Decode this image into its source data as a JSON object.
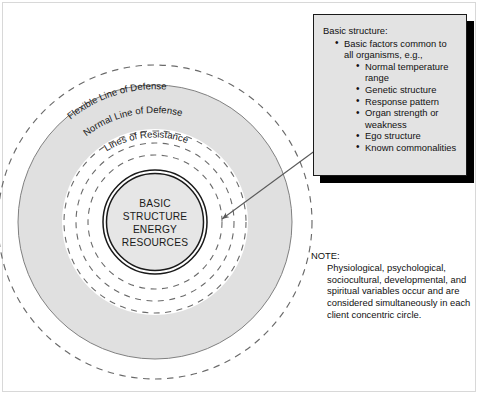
{
  "figure": {
    "colors": {
      "ring_fill": "#e0e0e0",
      "line": "#4a4a4a",
      "core_line": "#1a1a1a",
      "callout_fill": "#e3e3e3",
      "callout_border": "#1a1a1a",
      "shadow": "#000000",
      "text": "#111111",
      "frame": "#d8d8d8"
    }
  },
  "diagram": {
    "ring_labels": [
      "Flexible Line of Defense",
      "Normal Line of Defense",
      "Lines of Resistance"
    ],
    "core_lines": [
      "BASIC",
      "STRUCTURE",
      "ENERGY",
      "RESOURCES"
    ],
    "leader_line": {
      "from_label": "callout-box",
      "to_label": "basic-structure-core",
      "arrowhead": "arrow-left-icon"
    }
  },
  "callout": {
    "title": "Basic structure:",
    "items": [
      {
        "text": "Basic factors common to all organisms, e.g.,",
        "children": [
          "Normal temperature range",
          "Genetic structure",
          "Response pattern",
          "Organ strength or weakness",
          "Ego structure",
          "Known commonalities"
        ]
      }
    ]
  },
  "note": {
    "label": "NOTE:",
    "body": "Physiological, psychological, sociocultural, developmental, and spiritual variables occur and are considered simultaneously in each client concentric circle."
  }
}
